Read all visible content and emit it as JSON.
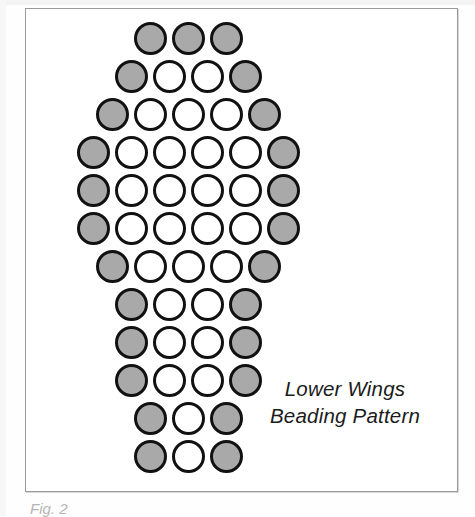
{
  "figure": {
    "caption_line1": "Lower Wings",
    "caption_line2": "Beading Pattern",
    "figure_number": "Fig. 2",
    "colors": {
      "bead_filled": "#a9a9a9",
      "bead_empty": "#ffffff",
      "bead_outline": "#111111",
      "frame": "#9a9a9a",
      "text": "#1b1b1b",
      "background": "#ffffff"
    }
  },
  "chart_data": {
    "type": "heatmap",
    "title": "Lower Wings Beading Pattern",
    "xlabel": "",
    "ylabel": "",
    "legend": [
      {
        "name": "filled bead",
        "symbol": "gray",
        "color": "#a9a9a9"
      },
      {
        "name": "empty bead",
        "symbol": "white",
        "color": "#ffffff"
      }
    ],
    "grid": false,
    "cell_width_px": 38,
    "cell_height_px": 38,
    "bead_diameter_px": 33,
    "row_count": 12,
    "total_beads": 55,
    "filled_beads": 27,
    "empty_beads": 28,
    "rows": [
      {
        "index": 1,
        "count": 3,
        "offset": 2.0,
        "beads": [
          "gray",
          "gray",
          "gray"
        ]
      },
      {
        "index": 2,
        "count": 4,
        "offset": 1.5,
        "beads": [
          "gray",
          "white",
          "white",
          "gray"
        ]
      },
      {
        "index": 3,
        "count": 5,
        "offset": 1.0,
        "beads": [
          "gray",
          "white",
          "white",
          "white",
          "gray"
        ]
      },
      {
        "index": 4,
        "count": 6,
        "offset": 0.5,
        "beads": [
          "gray",
          "white",
          "white",
          "white",
          "white",
          "gray"
        ]
      },
      {
        "index": 5,
        "count": 6,
        "offset": 0.5,
        "beads": [
          "gray",
          "white",
          "white",
          "white",
          "white",
          "gray"
        ]
      },
      {
        "index": 6,
        "count": 6,
        "offset": 0.5,
        "beads": [
          "gray",
          "white",
          "white",
          "white",
          "white",
          "gray"
        ]
      },
      {
        "index": 7,
        "count": 5,
        "offset": 1.0,
        "beads": [
          "gray",
          "white",
          "white",
          "white",
          "gray"
        ]
      },
      {
        "index": 8,
        "count": 4,
        "offset": 1.5,
        "beads": [
          "gray",
          "white",
          "white",
          "gray"
        ]
      },
      {
        "index": 9,
        "count": 4,
        "offset": 1.5,
        "beads": [
          "gray",
          "white",
          "white",
          "gray"
        ]
      },
      {
        "index": 10,
        "count": 4,
        "offset": 1.5,
        "beads": [
          "gray",
          "white",
          "white",
          "gray"
        ]
      },
      {
        "index": 11,
        "count": 3,
        "offset": 2.0,
        "beads": [
          "gray",
          "white",
          "gray"
        ]
      },
      {
        "index": 12,
        "count": 3,
        "offset": 2.0,
        "beads": [
          "gray",
          "white",
          "gray"
        ]
      }
    ]
  }
}
